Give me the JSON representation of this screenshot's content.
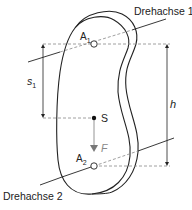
{
  "diagram": {
    "labels": {
      "axis1": "Drehachse 1",
      "axis2": "Drehachse 2",
      "pivot1": "A",
      "pivot1_sub": "1",
      "pivot2": "A",
      "pivot2_sub": "2",
      "center_of_mass": "S",
      "force": "F",
      "distance_s": "s",
      "distance_s_sub": "1",
      "distance_h": "h"
    },
    "colors": {
      "line": "#222222",
      "dashed": "#888888",
      "force": "#888888",
      "background": "#ffffff"
    }
  }
}
